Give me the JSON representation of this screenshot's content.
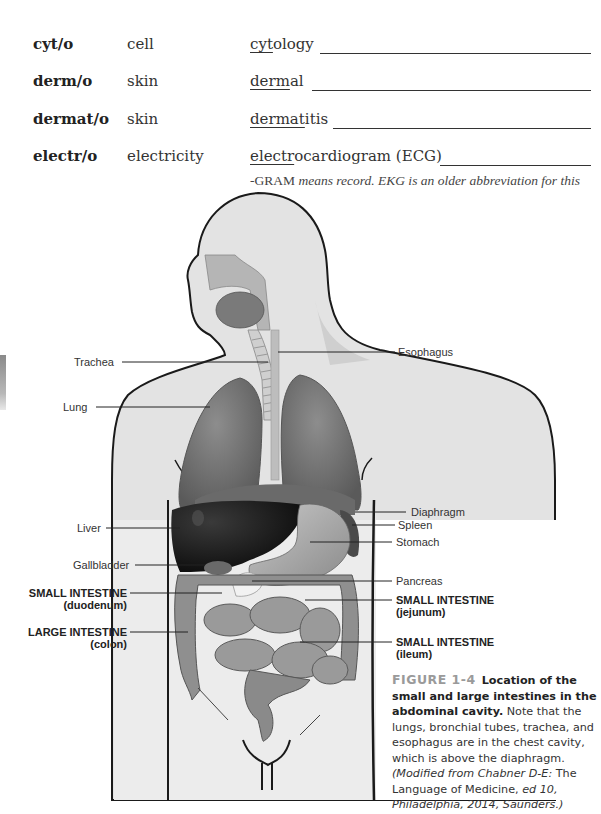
{
  "terms": [
    {
      "root": "cyt/o",
      "meaning": "cell",
      "example_root": "cyt",
      "example_rest": "ology"
    },
    {
      "root": "derm/o",
      "meaning": "skin",
      "example_root": "derm",
      "example_rest": "al"
    },
    {
      "root": "dermat/o",
      "meaning": "skin",
      "example_root": "dermat",
      "example_rest": "itis"
    },
    {
      "root": "electr/o",
      "meaning": "electricity",
      "example_root": "electr",
      "example_rest": "ocardiogram (ECG)"
    }
  ],
  "note": {
    "prefix": "-GRAM",
    "italic_text": " means record. EKG is an older abbreviation for this test."
  },
  "figure": {
    "labels_left": {
      "trachea": "Trachea",
      "lung": "Lung",
      "liver": "Liver",
      "gallbladder": "Gallbladder",
      "small_intestine_duodenum_1": "SMALL INTESTINE",
      "small_intestine_duodenum_2": "(duodenum)",
      "large_intestine_1": "LARGE INTESTINE",
      "large_intestine_2": "(colon)"
    },
    "labels_right": {
      "esophagus": "Esophagus",
      "diaphragm": "Diaphragm",
      "spleen": "Spleen",
      "stomach": "Stomach",
      "pancreas": "Pancreas",
      "small_intestine_jejunum_1": "SMALL INTESTINE",
      "small_intestine_jejunum_2": "(jejunum)",
      "small_intestine_ileum_1": "SMALL INTESTINE",
      "small_intestine_ileum_2": "(ileum)"
    }
  },
  "caption": {
    "figure_number": "FIGURE 1-4",
    "title": "Location of the small and large intestines in the abdominal cavity.",
    "body": " Note that the lungs, bronchial tubes, trachea, and esophagus are in the chest cavity, which is above the diaphragm. ",
    "source_italic_1": "(Modified from Chabner D-E:",
    "source_plain_1": " The Language of Medicine, ",
    "source_italic_2": "ed 10, Philadelphia, 2014, Saunders.)"
  },
  "colors": {
    "side_tab": "#9a9a9a",
    "figure_number": "#9a9a9a",
    "text": "#333333"
  }
}
